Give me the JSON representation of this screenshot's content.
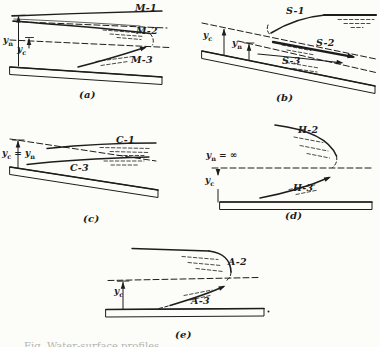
{
  "caption_clipped": "Fig. Water-surface profiles.",
  "panels": {
    "a": {
      "label": "(a)",
      "curves": {
        "c1": "M-1",
        "c2": "M-2",
        "c3": "M-3"
      },
      "depths": {
        "yn": {
          "base": "y",
          "sub": "n"
        },
        "yc": {
          "base": "y",
          "sub": "c"
        }
      }
    },
    "b": {
      "label": "(b)",
      "curves": {
        "c1": "S-1",
        "c2": "S-2",
        "c3": "S-3"
      },
      "depths": {
        "yc": {
          "base": "y",
          "sub": "c"
        },
        "yn": {
          "base": "y",
          "sub": "n"
        }
      }
    },
    "c": {
      "label": "(c)",
      "curves": {
        "c1": "C-1",
        "c3": "C-3"
      },
      "depths": {
        "eq": {
          "base": "y",
          "sub": "c",
          "mid": " = ",
          "base2": "y",
          "sub2": "n"
        }
      }
    },
    "d": {
      "label": "(d)",
      "curves": {
        "c2": "H-2",
        "c3": "H-3"
      },
      "depths": {
        "yn_inf": {
          "base": "y",
          "sub": "n",
          "suffix": " = ∞"
        },
        "yc": {
          "base": "y",
          "sub": "c"
        }
      }
    },
    "e": {
      "label": "(e)",
      "curves": {
        "c2": "A-2",
        "c3": "A-3"
      },
      "depths": {
        "yc": {
          "base": "y",
          "sub": "c"
        }
      }
    }
  }
}
